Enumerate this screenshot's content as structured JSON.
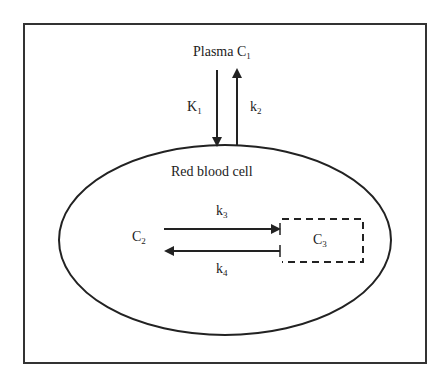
{
  "diagram": {
    "plasma": {
      "label": "Plasma C",
      "sub": "1"
    },
    "rate_k1": {
      "label": "K",
      "sub": "1"
    },
    "rate_k2": {
      "label": "k",
      "sub": "2"
    },
    "cell": {
      "label": "Red blood cell"
    },
    "compartment_c2": {
      "label": "C",
      "sub": "2"
    },
    "compartment_c3": {
      "label": "C",
      "sub": "3"
    },
    "rate_k3": {
      "label": "k",
      "sub": "3"
    },
    "rate_k4": {
      "label": "k",
      "sub": "4"
    },
    "colors": {
      "stroke": "#222222",
      "background": "#ffffff"
    }
  }
}
